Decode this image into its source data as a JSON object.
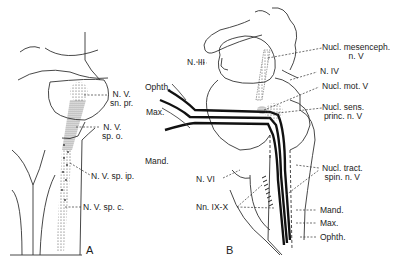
{
  "panelA": {
    "letter": "A",
    "labels": {
      "sn_pr_1": "N. V.",
      "sn_pr_2": "sn. pr.",
      "sp_o_1": "N. V.",
      "sp_o_2": "sp. o.",
      "sp_ip": "N. V. sp. ip.",
      "sp_c": "N. V. sp. c."
    }
  },
  "panelB": {
    "letter": "B",
    "labels": {
      "ophth_left": "Ophth.",
      "max_left": "Max.",
      "mand_left": "Mand.",
      "n_iii": "N. III",
      "n_vi": "N. VI",
      "nn_ix_x": "Nn. IX-X",
      "mesenceph_1": "Nucl. mesenceph.",
      "mesenceph_2": "n. V",
      "n_iv": "N. IV",
      "mot_v": "Nucl. mot. V",
      "sens_1": "Nucl. sens.",
      "sens_2": "princ. n. V",
      "tract_1": "Nucl. tract.",
      "tract_2": "spin. n. V",
      "mand_right": "Mand.",
      "max_right": "Max.",
      "ophth_right": "Ophth."
    }
  }
}
